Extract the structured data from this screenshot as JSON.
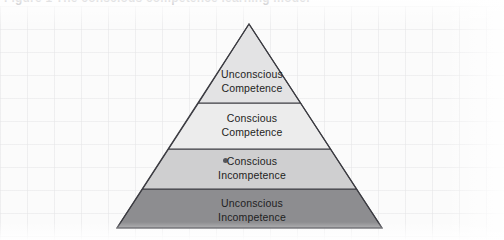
{
  "figure": {
    "caption": "Figure 1  The conscious competence learning model",
    "caption_visible": "clipped-top-edge",
    "background_color": "#fcfcfc",
    "outline_color": "#3c3c42"
  },
  "pyramid": {
    "name": "conscious-competence-pyramid",
    "apex": {
      "x": 249,
      "y": 25
    },
    "base_left": {
      "x": 117,
      "y": 228
    },
    "base_right": {
      "x": 382,
      "y": 228
    },
    "divider_y": [
      103,
      149,
      189
    ],
    "tiers": [
      {
        "index": 1,
        "position": "top",
        "line1": "Unconscious",
        "line2": "Competence",
        "fill": "#e3e3e4",
        "text_color": "#1e1e22"
      },
      {
        "index": 2,
        "position": "upper-middle",
        "line1": "Conscious",
        "line2": "Competence",
        "fill": "#ececec",
        "text_color": "#1e1e22"
      },
      {
        "index": 3,
        "position": "lower-middle",
        "line1": "Conscious",
        "line2": "Incompetence",
        "fill": "#cfcfd0",
        "text_color": "#1e1e22"
      },
      {
        "index": 4,
        "position": "bottom",
        "line1": "Unconscious",
        "line2": "Incompetence",
        "fill": "#8d8d90",
        "text_color": "#17171a"
      }
    ]
  }
}
